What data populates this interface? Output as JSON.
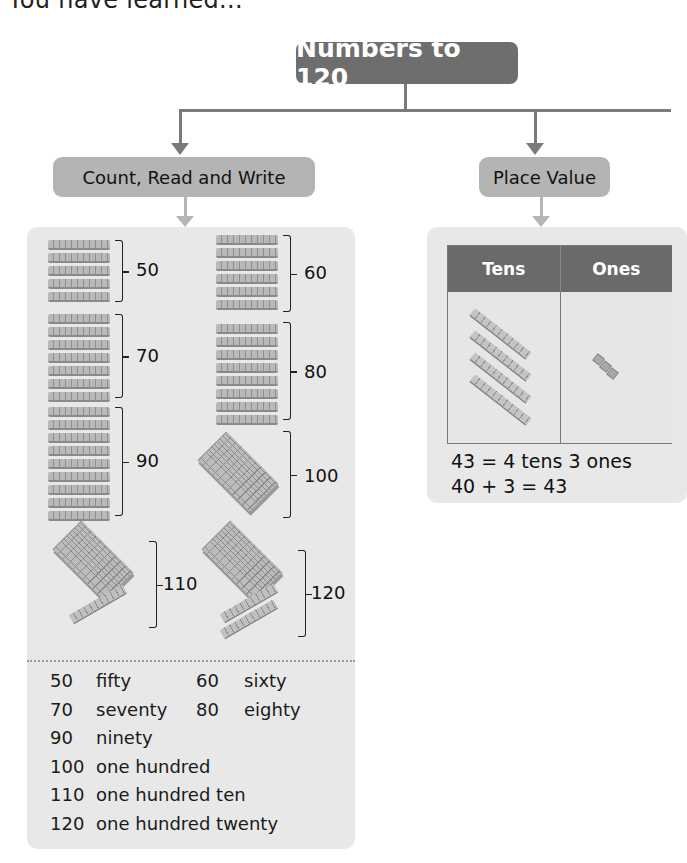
{
  "page": {
    "partial_heading": "You have learned..."
  },
  "concept_map": {
    "root": {
      "title": "Numbers to 120"
    },
    "branches": [
      {
        "label": "Count, Read and Write"
      },
      {
        "label": "Place Value"
      }
    ]
  },
  "count_read_write": {
    "groups": [
      {
        "value": "50",
        "tens": 5,
        "hundreds": 0
      },
      {
        "value": "60",
        "tens": 6,
        "hundreds": 0
      },
      {
        "value": "70",
        "tens": 7,
        "hundreds": 0
      },
      {
        "value": "80",
        "tens": 8,
        "hundreds": 0
      },
      {
        "value": "90",
        "tens": 9,
        "hundreds": 0
      },
      {
        "value": "100",
        "tens": 0,
        "hundreds": 1
      },
      {
        "value": "110",
        "tens": 1,
        "hundreds": 1
      },
      {
        "value": "120",
        "tens": 2,
        "hundreds": 1
      }
    ],
    "number_words": [
      {
        "num": "50",
        "word": "fifty"
      },
      {
        "num": "60",
        "word": "sixty"
      },
      {
        "num": "70",
        "word": "seventy"
      },
      {
        "num": "80",
        "word": "eighty"
      },
      {
        "num": "90",
        "word": "ninety"
      },
      {
        "num": "100",
        "word": "one hundred"
      },
      {
        "num": "110",
        "word": "one hundred ten"
      },
      {
        "num": "120",
        "word": "one hundred twenty"
      }
    ]
  },
  "place_value": {
    "headers": [
      "Tens",
      "Ones"
    ],
    "tens_count": 4,
    "ones_count": 3,
    "equations": [
      "43 = 4 tens 3 ones",
      "40 + 3 = 43"
    ]
  },
  "colors": {
    "root_fill": "#6e6e6e",
    "branch_fill": "#b4b4b4",
    "panel_fill": "#e8e8e8",
    "table_header": "#6a6a6a",
    "connector": "#7a7a7a"
  }
}
